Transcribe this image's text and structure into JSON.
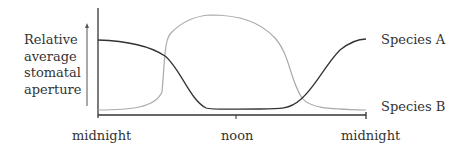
{
  "diagram": {
    "y_axis_label": [
      "Relative",
      "average",
      "stomatal",
      "aperture"
    ],
    "x_ticks": [
      "midnight",
      "noon",
      "midnight"
    ],
    "series": [
      {
        "name": "Species A",
        "color": "#333333",
        "description": "high at night, low during day"
      },
      {
        "name": "Species B",
        "color": "#aaaaaa",
        "description": "low at night, high during day"
      }
    ]
  }
}
